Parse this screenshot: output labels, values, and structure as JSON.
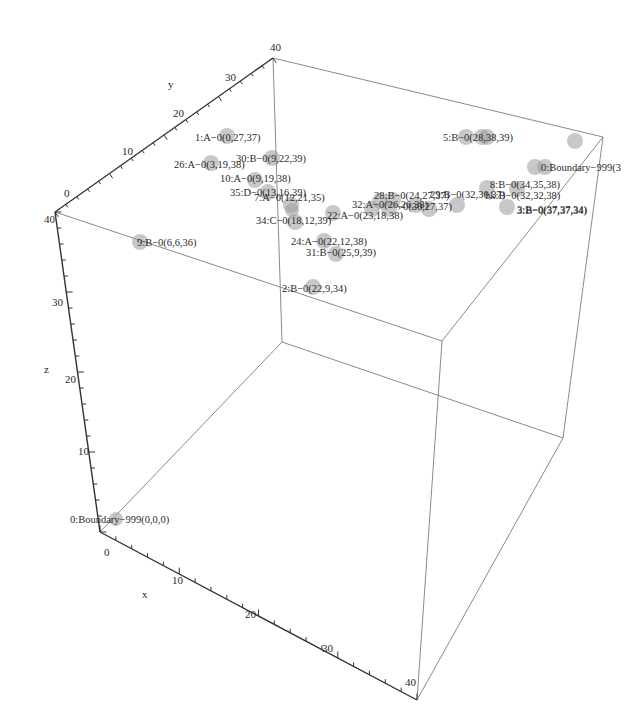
{
  "chart_data": {
    "type": "scatter3d",
    "title": "",
    "xlabel": "x",
    "ylabel": "y",
    "zlabel": "z",
    "xlim": [
      0,
      40
    ],
    "ylim": [
      0,
      40
    ],
    "zlim": [
      0,
      40
    ],
    "x_ticks": [
      "0",
      "10",
      "20",
      "30",
      "40"
    ],
    "y_ticks": [
      "0",
      "10",
      "20",
      "30",
      "40"
    ],
    "z_ticks": [
      "20",
      "30",
      "40"
    ],
    "grid": false,
    "box": true,
    "marker_color": "#9a9a9a",
    "points": [
      {
        "label": "0:Boundary-999(0,0,0)",
        "x": 0,
        "y": 0,
        "z": 0
      },
      {
        "label": "0:Boundary-999(3",
        "x": 40,
        "y": 40,
        "z": 38
      },
      {
        "label": "1:A-0(0,27,37)",
        "x": 0,
        "y": 27,
        "z": 37
      },
      {
        "label": "2:B-0(22,9,34)",
        "x": 22,
        "y": 9,
        "z": 34
      },
      {
        "label": "3:B-0(37,37,34)",
        "x": 37,
        "y": 37,
        "z": 34
      },
      {
        "label": "5:B-0(28,38,39)",
        "x": 28,
        "y": 38,
        "z": 39
      },
      {
        "label": "7:A-0(12,21,35)",
        "x": 12,
        "y": 21,
        "z": 35
      },
      {
        "label": "8:B-0(34,35,38)",
        "x": 34,
        "y": 35,
        "z": 38
      },
      {
        "label": "9:B-0(6,6,36)",
        "x": 6,
        "y": 6,
        "z": 36
      },
      {
        "label": "10:A-0(9,19,38)",
        "x": 9,
        "y": 19,
        "z": 38
      },
      {
        "label": "22:A-0(23,18,38)",
        "x": 23,
        "y": 18,
        "z": 38
      },
      {
        "label": "24:A-0(22,12,38)",
        "x": 22,
        "y": 12,
        "z": 38
      },
      {
        "label": "26:A-0(3,19,38)",
        "x": 3,
        "y": 19,
        "z": 38
      },
      {
        "label": "28:B-0(24,27,37)",
        "x": 24,
        "y": 27,
        "z": 37
      },
      {
        "label": "29:B-0(32,30,37)",
        "x": 32,
        "y": 30,
        "z": 37
      },
      {
        "label": "30:B-0(9,22,39)",
        "x": 9,
        "y": 22,
        "z": 39
      },
      {
        "label": "31:B-0(25,9,39)",
        "x": 25,
        "y": 9,
        "z": 39
      },
      {
        "label": "32:A-0(26,26,38)",
        "x": 26,
        "y": 26,
        "z": 38
      },
      {
        "label": "34:C-0(18,12,39)",
        "x": 18,
        "y": 12,
        "z": 39
      },
      {
        "label": "35:D-0(13,16,39)",
        "x": 13,
        "y": 16,
        "z": 39
      },
      {
        "label": "(30,27,37)",
        "x": 30,
        "y": 27,
        "z": 37
      },
      {
        "label": "bk:B-0(32,32,38)",
        "x": 36,
        "y": 36,
        "z": 38
      }
    ]
  },
  "render": {
    "ticks": {
      "x": [
        {
          "text": "0",
          "x": 104,
          "y": 556
        },
        {
          "text": "10",
          "x": 172,
          "y": 584
        },
        {
          "text": "20",
          "x": 245,
          "y": 618
        },
        {
          "text": "30",
          "x": 322,
          "y": 652
        },
        {
          "text": "40",
          "x": 405,
          "y": 686
        }
      ],
      "y": [
        {
          "text": "0",
          "x": 64,
          "y": 197
        },
        {
          "text": "10",
          "x": 122,
          "y": 155
        },
        {
          "text": "20",
          "x": 173,
          "y": 117
        },
        {
          "text": "30",
          "x": 225,
          "y": 81
        },
        {
          "text": "40",
          "x": 270,
          "y": 51
        }
      ],
      "z": [
        {
          "text": "40",
          "x": 44,
          "y": 223
        },
        {
          "text": "30",
          "x": 52,
          "y": 306
        },
        {
          "text": "20",
          "x": 65,
          "y": 383
        },
        {
          "text": "10",
          "x": 78,
          "y": 455
        }
      ]
    },
    "axis_labels": {
      "x": {
        "text": "x",
        "x": 142,
        "y": 598
      },
      "y": {
        "text": "y",
        "x": 168,
        "y": 88
      },
      "z": {
        "text": "z",
        "x": 44,
        "y": 373
      }
    },
    "markers": [
      {
        "cx": 116,
        "cy": 519,
        "r": 7
      },
      {
        "cx": 575,
        "cy": 141,
        "r": 8
      },
      {
        "cx": 227,
        "cy": 136,
        "r": 8
      },
      {
        "cx": 313,
        "cy": 287,
        "r": 8
      },
      {
        "cx": 507,
        "cy": 207,
        "r": 8
      },
      {
        "cx": 482,
        "cy": 137,
        "r": 8
      },
      {
        "cx": 487,
        "cy": 137,
        "r": 8
      },
      {
        "cx": 466,
        "cy": 137,
        "r": 8
      },
      {
        "cx": 291,
        "cy": 205,
        "r": 8
      },
      {
        "cx": 535,
        "cy": 167,
        "r": 8
      },
      {
        "cx": 545,
        "cy": 167,
        "r": 8
      },
      {
        "cx": 140,
        "cy": 242,
        "r": 8
      },
      {
        "cx": 255,
        "cy": 180,
        "r": 8
      },
      {
        "cx": 333,
        "cy": 213,
        "r": 8
      },
      {
        "cx": 324,
        "cy": 241,
        "r": 8
      },
      {
        "cx": 211,
        "cy": 163,
        "r": 8
      },
      {
        "cx": 416,
        "cy": 205,
        "r": 8
      },
      {
        "cx": 429,
        "cy": 209,
        "r": 8
      },
      {
        "cx": 389,
        "cy": 209,
        "r": 8
      },
      {
        "cx": 393,
        "cy": 200,
        "r": 8
      },
      {
        "cx": 272,
        "cy": 158,
        "r": 8
      },
      {
        "cx": 336,
        "cy": 254,
        "r": 8
      },
      {
        "cx": 380,
        "cy": 201,
        "r": 8
      },
      {
        "cx": 372,
        "cy": 209,
        "r": 8
      },
      {
        "cx": 295,
        "cy": 222,
        "r": 8
      },
      {
        "cx": 268,
        "cy": 192,
        "r": 8
      },
      {
        "cx": 292,
        "cy": 210,
        "r": 7
      },
      {
        "cx": 457,
        "cy": 205,
        "r": 8
      },
      {
        "cx": 487,
        "cy": 188,
        "r": 8
      },
      {
        "cx": 517,
        "cy": 189,
        "r": 8
      }
    ],
    "labels": [
      {
        "text": "0:Boundary−999(0,0,0)",
        "x": 70,
        "y": 523
      },
      {
        "text": "0:Boundary−999(3",
        "x": 541,
        "y": 171
      },
      {
        "text": "1:A−0(0,27,37)",
        "x": 195,
        "y": 141
      },
      {
        "text": "2:B−0(22,9,34)",
        "x": 282,
        "y": 292
      },
      {
        "text": "3:B−0(37,37,34)",
        "x": 517,
        "y": 213
      },
      {
        "text": "5:B−0(28,38,39)",
        "x": 443,
        "y": 141
      },
      {
        "text": "7:A−0(12,21,35)",
        "x": 254,
        "y": 201
      },
      {
        "text": "8:B−0(34,35,38)",
        "x": 490,
        "y": 188
      },
      {
        "text": "9:B−0(6,6,36)",
        "x": 137,
        "y": 246
      },
      {
        "text": "10:A−0(9,19,38)",
        "x": 220,
        "y": 182
      },
      {
        "text": "22:A−0(23,18,38)",
        "x": 327,
        "y": 219
      },
      {
        "text": "24:A−0(22,12,38)",
        "x": 291,
        "y": 245
      },
      {
        "text": "26:A−0(3,19,38)",
        "x": 174,
        "y": 168
      },
      {
        "text": "28:B−0(24,27,37)",
        "x": 374,
        "y": 199
      },
      {
        "text": "29:B−0(32,30,37)",
        "x": 430,
        "y": 198
      },
      {
        "text": "30:B−0(9,22,39)",
        "x": 236,
        "y": 162
      },
      {
        "text": "31:B−0(25,9,39)",
        "x": 306,
        "y": 256
      },
      {
        "text": "32:A−0(26,26,38)",
        "x": 352,
        "y": 208
      },
      {
        "text": "34:C−0(18,12,39)",
        "x": 256,
        "y": 224
      },
      {
        "text": "35:D−0(13,16,39)",
        "x": 230,
        "y": 196
      },
      {
        "text": "−0(30,27,37)",
        "x": 397,
        "y": 210
      },
      {
        "text": "bk:B−0(32,32,38)",
        "x": 485,
        "y": 199
      },
      {
        "text": "3:B−0(37,37,34)",
        "x": 517,
        "y": 214
      }
    ]
  }
}
